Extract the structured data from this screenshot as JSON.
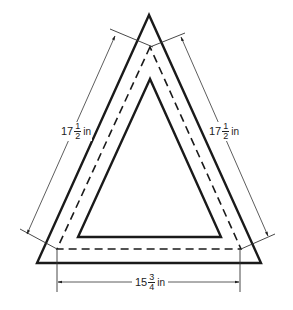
{
  "diagram": {
    "colors": {
      "line": "#1a1a1a",
      "dim_line": "#333333",
      "background": "#ffffff"
    },
    "shapes": {
      "outer_triangle": {
        "style": "solid-thick"
      },
      "seam_triangle": {
        "style": "dashed"
      },
      "inner_triangle": {
        "style": "solid-thick"
      }
    },
    "dimensions": {
      "left": {
        "whole": "17",
        "num": "1",
        "den": "2",
        "unit": "in"
      },
      "right": {
        "whole": "17",
        "num": "1",
        "den": "2",
        "unit": "in"
      },
      "bottom": {
        "whole": "15",
        "num": "3",
        "den": "4",
        "unit": "in"
      }
    }
  }
}
